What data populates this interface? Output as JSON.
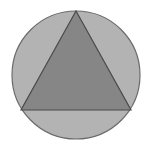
{
  "figure": {
    "title": "Triangle inscribed in circle",
    "canvas": {
      "width": 151,
      "height": 149,
      "background_color": "#ffffff"
    },
    "circle": {
      "name": "outer-circle",
      "center_x": 76,
      "center_y": 75,
      "radius": 64,
      "fill_color": "#b3b3b3",
      "stroke_color": "#6b6b6b",
      "stroke_width": 1.2
    },
    "triangle": {
      "name": "inscribed-triangle",
      "points": "76,11 21,110 131,110",
      "apex": {
        "x": 76,
        "y": 11
      },
      "bottom_left": {
        "x": 21,
        "y": 110
      },
      "bottom_right": {
        "x": 131,
        "y": 110
      },
      "fill_color": "#868686",
      "stroke_color": "#4a4a4a",
      "stroke_width": 1.2
    }
  }
}
